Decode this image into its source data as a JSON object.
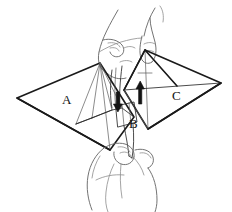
{
  "figure": {
    "width": 232,
    "height": 212,
    "background_color": "#ffffff"
  },
  "labels": [
    {
      "id": "A",
      "text": "A",
      "x": 62,
      "y": 104,
      "meaning": "left-wing-panel"
    },
    {
      "id": "B",
      "text": "B",
      "x": 129,
      "y": 128,
      "meaning": "center-flap-panel"
    },
    {
      "id": "C",
      "text": "C",
      "x": 172,
      "y": 100,
      "meaning": "right-wing-panel"
    }
  ],
  "panels": [
    {
      "id": "A",
      "name": "left-wing",
      "fill": "#ffffff",
      "stroke": "#1a1a1a",
      "outline": "17,98 100,63 134,117 110,150"
    },
    {
      "id": "C",
      "name": "right-wing",
      "fill": "#e9e9e9",
      "stroke": "#1a1a1a",
      "outline": "145,50 221,83 148,129 124,90"
    },
    {
      "id": "B",
      "name": "center-flap",
      "fill": "#f3f3f3",
      "stroke": "#1a1a1a",
      "outline": "116,108 134,103 137,122 119,127"
    }
  ],
  "arrows": [
    {
      "id": "arrow-down",
      "name": "fold-arrow-down",
      "direction": "down",
      "x": 118,
      "y": 107,
      "color": "#141414"
    },
    {
      "id": "arrow-up",
      "name": "fold-arrow-up",
      "direction": "up",
      "x": 140,
      "y": 90,
      "color": "#141414"
    }
  ],
  "hands": [
    {
      "id": "upper-hand",
      "name": "upper-hand",
      "stroke": "#6b6b6b",
      "position": "top-center"
    },
    {
      "id": "lower-hand",
      "name": "lower-hand",
      "stroke": "#6b6b6b",
      "position": "bottom-center"
    }
  ],
  "colors": {
    "ink": "#1a1a1a",
    "fold": "#5a5a5a",
    "hand": "#6b6b6b",
    "shade": "#e9e9e9",
    "paper": "#ffffff"
  }
}
